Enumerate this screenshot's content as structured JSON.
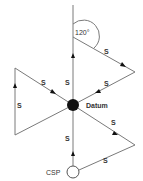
{
  "diagram": {
    "title": "",
    "angle_label": "120°",
    "datum_label": "Datum",
    "start_label": "CSP",
    "segment_label": "S",
    "segment_labels": [
      "S",
      "S",
      "S",
      "S",
      "S",
      "S",
      "S",
      "S",
      "S"
    ],
    "colors": {
      "line": "#7a7a7a",
      "datum_fill": "#111111",
      "arrow": "#111111",
      "text": "#333333"
    }
  }
}
